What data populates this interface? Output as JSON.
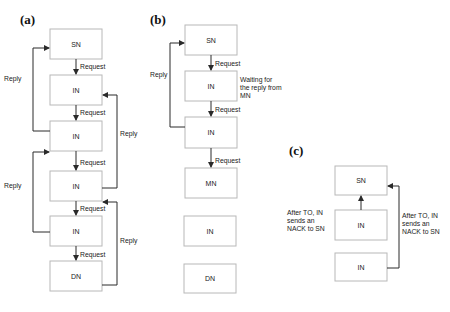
{
  "panels": {
    "a": {
      "label": "(a)",
      "nodes": [
        "SN",
        "IN",
        "IN",
        "IN",
        "IN",
        "DN"
      ],
      "request_labels": [
        "Request",
        "Request",
        "Request",
        "Request",
        "Request"
      ],
      "reply_left": [
        "Reply",
        "Reply"
      ],
      "reply_right": [
        "Reply",
        "Reply"
      ]
    },
    "b": {
      "label": "(b)",
      "nodes": [
        "SN",
        "IN",
        "IN",
        "MN",
        "IN",
        "DN"
      ],
      "request_labels": [
        "Request",
        "Request",
        "Request"
      ],
      "reply_left": "Reply",
      "note": [
        "Waiting for",
        "the reply from",
        "MN"
      ]
    },
    "c": {
      "label": "(c)",
      "nodes": [
        "SN",
        "IN",
        "IN"
      ],
      "note_left": [
        "After TO, IN",
        "sends an",
        "NACK to SN"
      ],
      "note_right": [
        "After TO, IN",
        "sends an",
        "NACK to SN"
      ]
    }
  }
}
